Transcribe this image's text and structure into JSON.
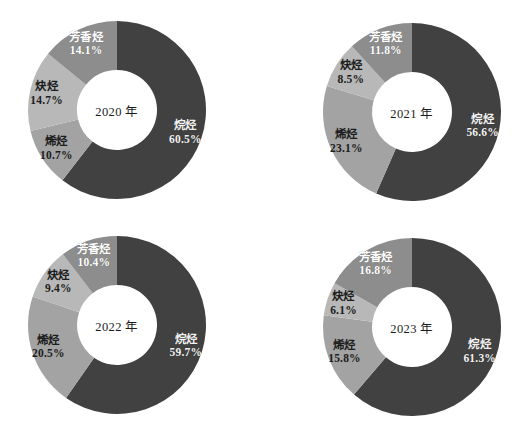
{
  "figure": {
    "background_color": "#ffffff",
    "layout": "2x2-grid-of-donut-charts"
  },
  "series_colors": {
    "alkane": "#414141",
    "alkene": "#a3a3a3",
    "alkyne": "#b8b8b8",
    "aromatic": "#8d8d8d"
  },
  "chart_data": [
    {
      "type": "pie",
      "title": "2020 年",
      "center_label": "2020 年",
      "donut": true,
      "categories": [
        "烷烃",
        "烯烃",
        "炔烃",
        "芳香烃"
      ],
      "values": [
        60.5,
        10.7,
        14.7,
        14.1
      ],
      "value_labels": [
        "60.5%",
        "10.7%",
        "14.7%",
        "14.1%"
      ],
      "colors": [
        "#414141",
        "#a3a3a3",
        "#b8b8b8",
        "#8d8d8d"
      ],
      "label_styles": [
        "label-on-dark",
        "label-on-light",
        "label-on-light",
        "label-on-mid"
      ],
      "legend": "none"
    },
    {
      "type": "pie",
      "title": "2021 年",
      "center_label": "2021 年",
      "donut": true,
      "categories": [
        "烷烃",
        "烯烃",
        "炔烃",
        "芳香烃"
      ],
      "values": [
        56.6,
        23.1,
        8.5,
        11.8
      ],
      "value_labels": [
        "56.6%",
        "23.1%",
        "8.5%",
        "11.8%"
      ],
      "colors": [
        "#414141",
        "#a3a3a3",
        "#b8b8b8",
        "#8d8d8d"
      ],
      "label_styles": [
        "label-on-dark",
        "label-on-light",
        "label-on-light",
        "label-on-mid"
      ],
      "legend": "none"
    },
    {
      "type": "pie",
      "title": "2022 年",
      "center_label": "2022 年",
      "donut": true,
      "categories": [
        "烷烃",
        "烯烃",
        "炔烃",
        "芳香烃"
      ],
      "values": [
        59.7,
        20.5,
        9.4,
        10.4
      ],
      "value_labels": [
        "59.7%",
        "20.5%",
        "9.4%",
        "10.4%"
      ],
      "colors": [
        "#414141",
        "#a3a3a3",
        "#b8b8b8",
        "#8d8d8d"
      ],
      "label_styles": [
        "label-on-dark",
        "label-on-light",
        "label-on-light",
        "label-on-mid"
      ],
      "legend": "none"
    },
    {
      "type": "pie",
      "title": "2023 年",
      "center_label": "2023 年",
      "donut": true,
      "categories": [
        "烷烃",
        "烯烃",
        "炔烃",
        "芳香烃"
      ],
      "values": [
        61.3,
        15.8,
        6.1,
        16.8
      ],
      "value_labels": [
        "61.3%",
        "15.8%",
        "6.1%",
        "16.8%"
      ],
      "colors": [
        "#414141",
        "#a3a3a3",
        "#b8b8b8",
        "#8d8d8d"
      ],
      "label_styles": [
        "label-on-dark",
        "label-on-light",
        "label-on-light",
        "label-on-mid"
      ],
      "legend": "none"
    }
  ],
  "chart_positions": [
    {
      "left": 2,
      "top": 3,
      "cx": 115,
      "cy": 107,
      "r_outer": 89,
      "r_inner": 40
    },
    {
      "left": 297,
      "top": 5,
      "cx": 115,
      "cy": 107,
      "r_outer": 89,
      "r_inner": 40
    },
    {
      "left": 2,
      "top": 218,
      "cx": 115,
      "cy": 107,
      "r_outer": 89,
      "r_inner": 40
    },
    {
      "left": 297,
      "top": 220,
      "cx": 115,
      "cy": 107,
      "r_outer": 89,
      "r_inner": 40
    }
  ],
  "label_radius_factor": 0.79
}
